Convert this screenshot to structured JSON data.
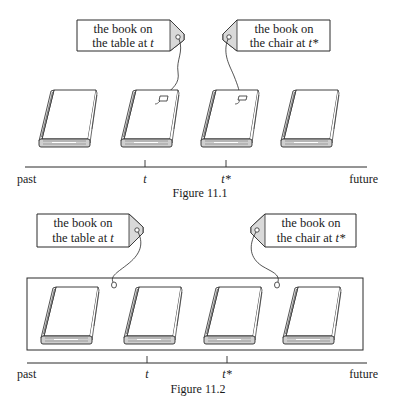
{
  "figures": [
    {
      "caption": "Figure 11.1",
      "tags": [
        {
          "line1": "the book on",
          "line2_prefix": "the table at ",
          "line2_var": "t"
        },
        {
          "line1": "the book on",
          "line2_prefix": "the chair at ",
          "line2_var": "t*"
        }
      ],
      "timeline": {
        "start": "past",
        "end": "future",
        "ticks": [
          "t",
          "t*"
        ]
      },
      "book_count": 4,
      "enclosed": false
    },
    {
      "caption": "Figure 11.2",
      "tags": [
        {
          "line1": "the book on",
          "line2_prefix": "the table at ",
          "line2_var": "t"
        },
        {
          "line1": "the book on",
          "line2_prefix": "the chair at ",
          "line2_var": "t*"
        }
      ],
      "timeline": {
        "start": "past",
        "end": "future",
        "ticks": [
          "t",
          "t*"
        ]
      },
      "book_count": 4,
      "enclosed": true
    }
  ],
  "colors": {
    "ink": "#2a2a2a",
    "tag_fill": "#ffffff",
    "tag_flap": "#d9d9d9",
    "spine": "#9a9a9a"
  }
}
